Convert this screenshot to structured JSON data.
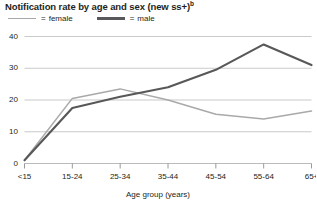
{
  "chart_data": {
    "type": "line",
    "title": "Notification rate by age and sex (new ss+)",
    "title_superscript": "b",
    "xlabel": "Age group (years)",
    "ylabel": "",
    "categories": [
      "<15",
      "15-24",
      "25-34",
      "35-44",
      "45-54",
      "55-64",
      "65+"
    ],
    "series": [
      {
        "name": "female",
        "color": "#a9a9a9",
        "values": [
          1.0,
          20.5,
          23.5,
          20.0,
          15.5,
          14.0,
          16.5
        ]
      },
      {
        "name": "male",
        "color": "#58585a",
        "values": [
          1.0,
          17.5,
          21.0,
          24.0,
          29.5,
          37.5,
          31.0
        ]
      }
    ],
    "ylim": [
      0,
      40
    ],
    "yticks": [
      0,
      10,
      20,
      30,
      40
    ],
    "ytick_labels": [
      "0",
      "10",
      "20",
      "30",
      "40"
    ],
    "grid": true,
    "legend_position": "top-left",
    "legend_separator": "="
  },
  "colors": {
    "female_line": "#a9a9a9",
    "male_line": "#58585a",
    "gridline": "#b3b3b3",
    "axis": "#808080",
    "text": "#231f20",
    "background": "#ffffff"
  }
}
